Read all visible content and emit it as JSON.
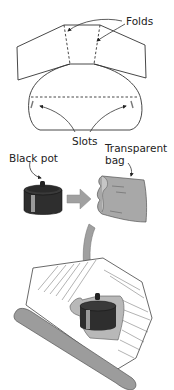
{
  "labels": {
    "folds": "Folds",
    "slots": "Slots",
    "black_pot": "Black pot",
    "transparent_bag_line1": "Transparent",
    "transparent_bag_line2": "bag"
  },
  "colors": {
    "line": "#333333",
    "pot": "#2e2e2e",
    "pot_highlight": "#9a9a9a",
    "bag": "#a8a8a8",
    "arrow": "#a0a0a0",
    "stick": "#9c9c9c"
  }
}
